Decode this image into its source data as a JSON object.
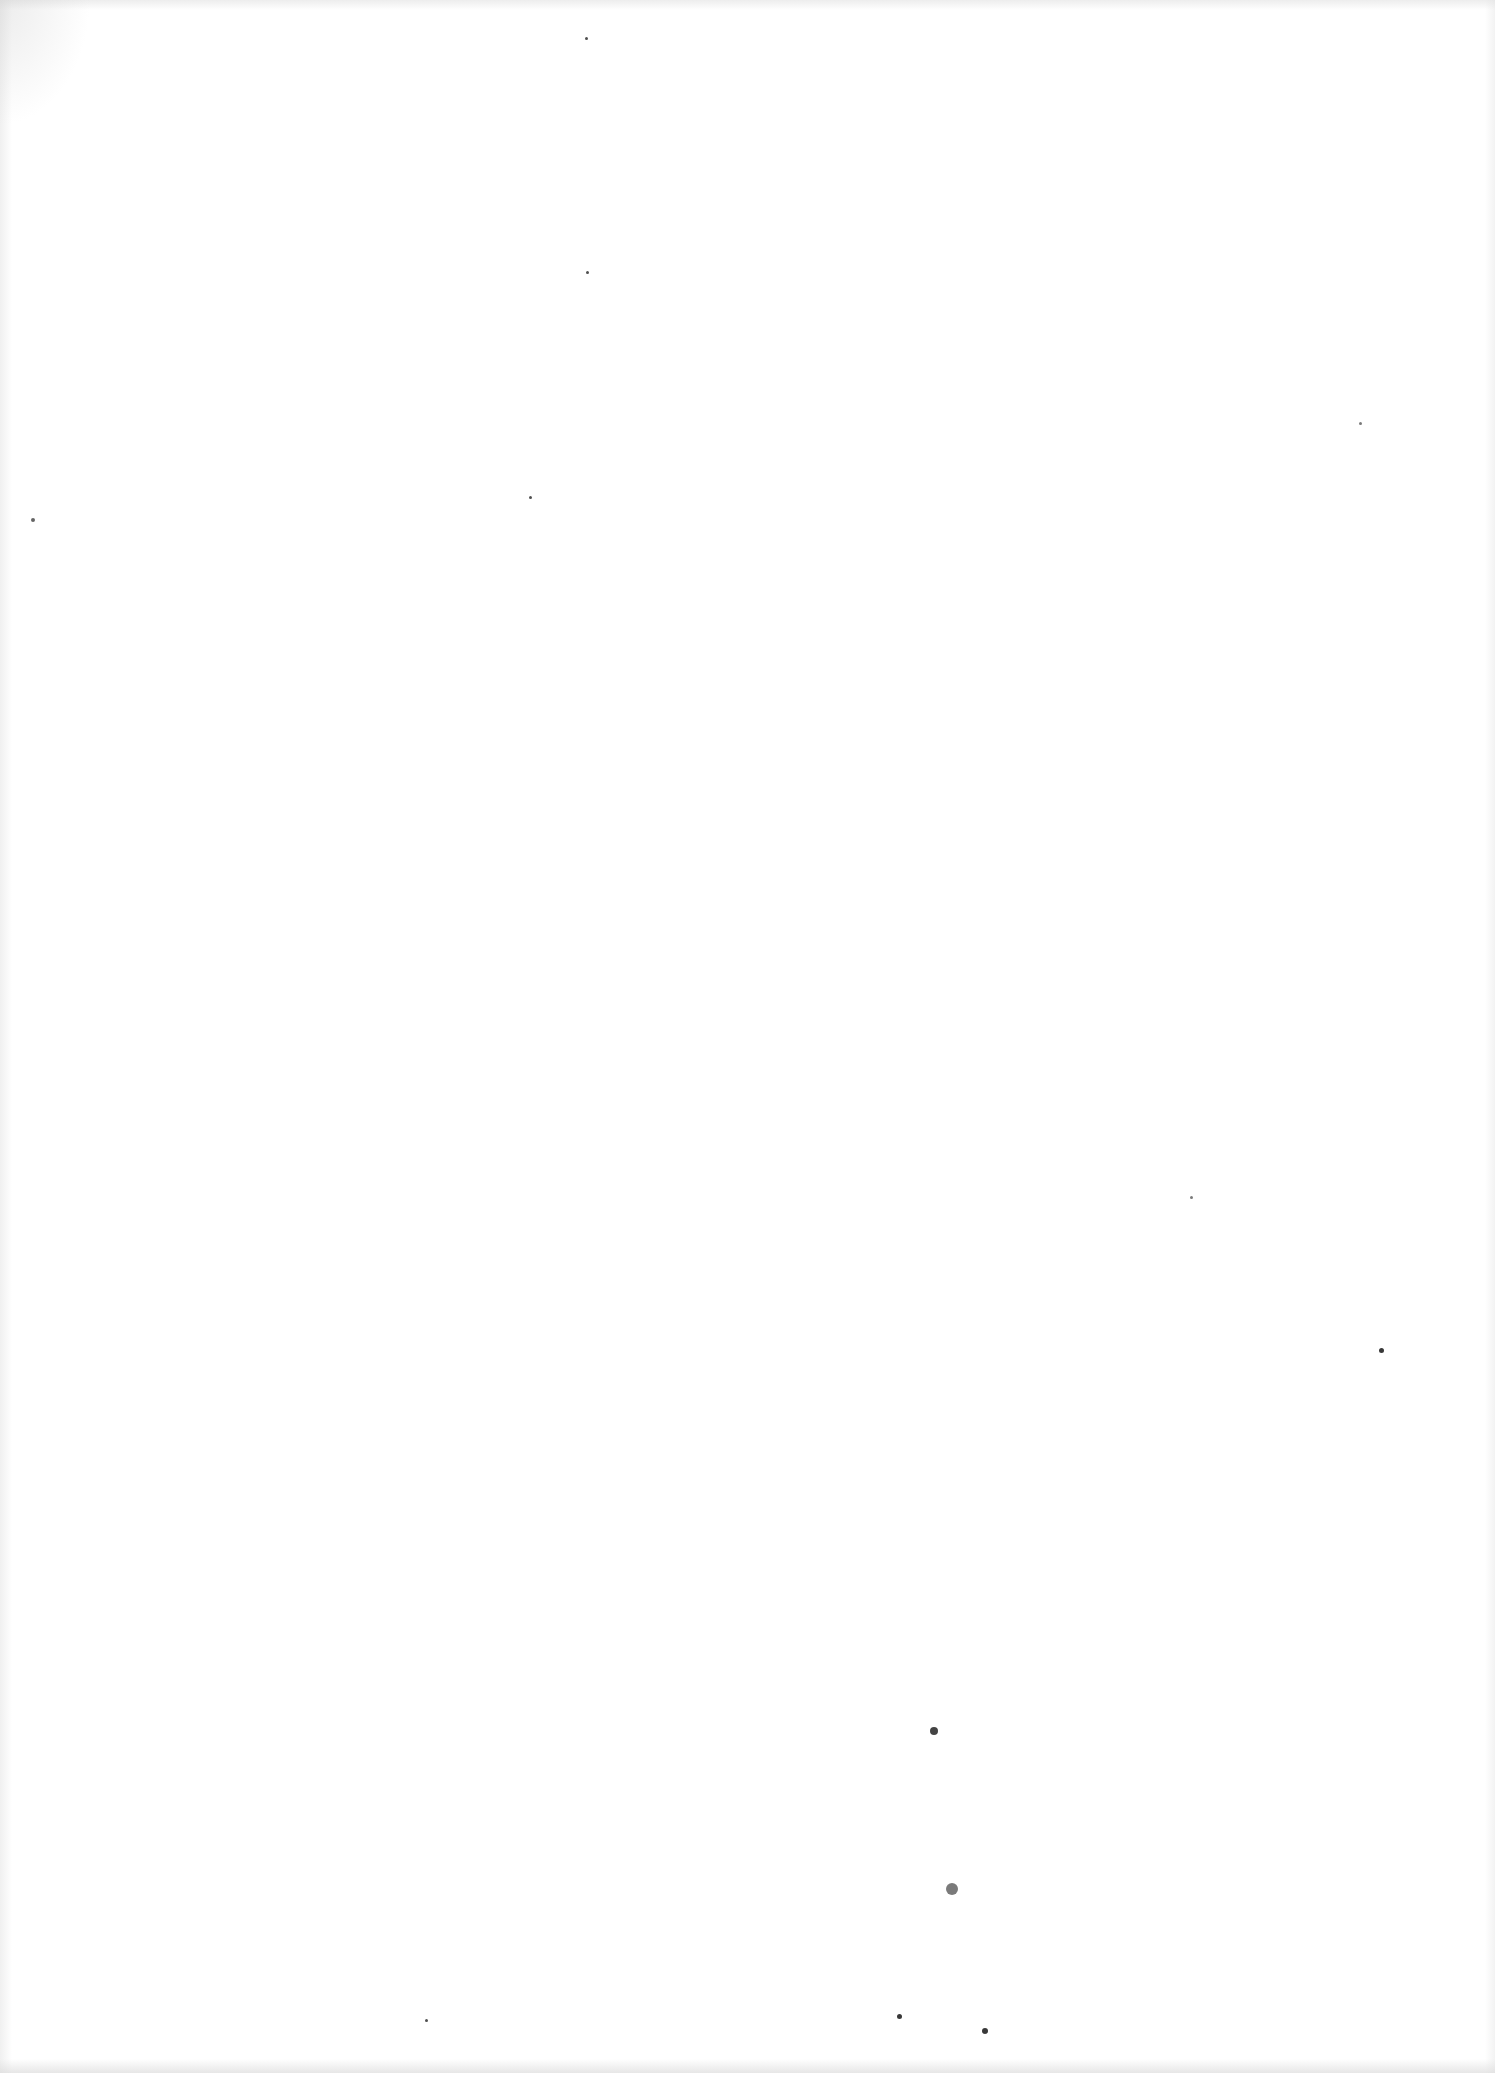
{
  "page": {
    "background": "#ffffff",
    "content": "",
    "specks": [
      {
        "x": 586,
        "y": 38,
        "r": 1.5,
        "o": 0.8
      },
      {
        "x": 587,
        "y": 272,
        "r": 1.5,
        "o": 0.8
      },
      {
        "x": 530,
        "y": 497,
        "r": 1.5,
        "o": 0.8
      },
      {
        "x": 33,
        "y": 520,
        "r": 2,
        "o": 0.7
      },
      {
        "x": 1360,
        "y": 423,
        "r": 1.5,
        "o": 0.6
      },
      {
        "x": 1191,
        "y": 1197,
        "r": 1.5,
        "o": 0.6
      },
      {
        "x": 1381,
        "y": 1350,
        "r": 2.5,
        "o": 0.9
      },
      {
        "x": 934,
        "y": 1731,
        "r": 4,
        "o": 0.85
      },
      {
        "x": 952,
        "y": 1889,
        "r": 6,
        "o": 0.6
      },
      {
        "x": 899,
        "y": 2016,
        "r": 2.5,
        "o": 0.9
      },
      {
        "x": 985,
        "y": 2031,
        "r": 3,
        "o": 0.9
      },
      {
        "x": 426,
        "y": 2020,
        "r": 1.5,
        "o": 0.8
      }
    ]
  }
}
